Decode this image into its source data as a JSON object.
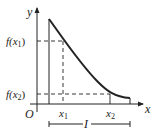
{
  "diagram": {
    "axes": {
      "x_label": "x",
      "y_label": "y",
      "origin_label": "O"
    },
    "points": [
      {
        "name": "x1",
        "x_label": "x",
        "x_sub": "1",
        "f_label": "f(x",
        "f_sub": "1",
        "f_close": ")"
      },
      {
        "name": "x2",
        "x_label": "x",
        "x_sub": "2",
        "f_label": "f(x",
        "f_sub": "2",
        "f_close": ")"
      }
    ],
    "interval_label": "I",
    "colors": {
      "ink": "#222222",
      "background": "#ffffff"
    }
  }
}
